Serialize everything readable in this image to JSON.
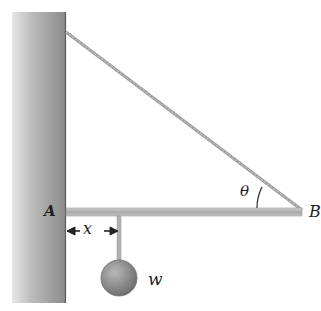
{
  "diagram": {
    "type": "statics-beam-cable",
    "labels": {
      "pivot": "A",
      "beam_end": "B",
      "angle": "θ",
      "distance": "x",
      "weight": "w"
    },
    "colors": {
      "wall_light": "#d4d4d4",
      "wall_dark": "#7a7a7a",
      "beam": "#b4b4b4",
      "cable": "#a8a8a8",
      "ball": "#8c8c8c",
      "text": "#1e1e1e"
    }
  }
}
